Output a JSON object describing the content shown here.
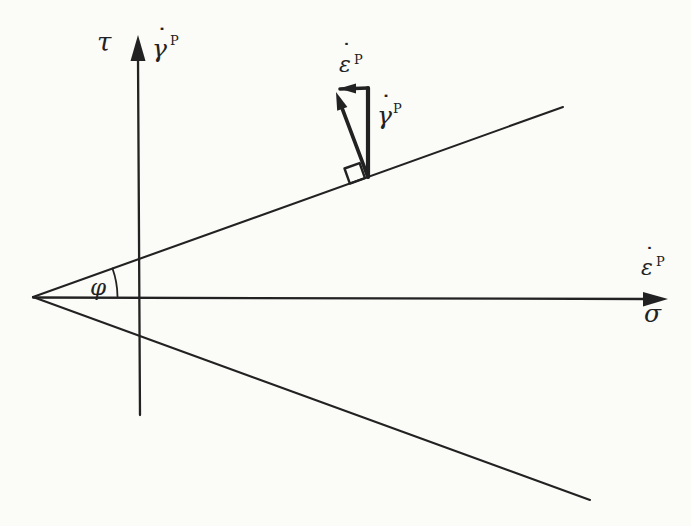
{
  "figure": {
    "background_color": "#fbfbf8",
    "ink_color": "#222222",
    "vertical_axis": {
      "stress_label": "τ",
      "strain_rate_label": {
        "base": "γ",
        "overdot": "˙",
        "superscript": "P"
      }
    },
    "horizontal_axis": {
      "stress_label": "σ",
      "strain_rate_label": {
        "base": "ε",
        "overdot": "˙",
        "superscript": "P"
      }
    },
    "friction_angle_label": "φ",
    "strain_rate_vector": {
      "normal_component_label": {
        "base": "ε",
        "overdot": "˙",
        "superscript": "P"
      },
      "shear_component_label": {
        "base": "γ",
        "overdot": "˙",
        "superscript": "P"
      }
    }
  }
}
